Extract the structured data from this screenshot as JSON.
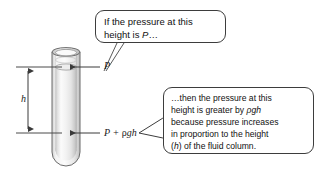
{
  "figure": {
    "background_color": "#ffffff"
  },
  "callouts": [
    {
      "id": "top",
      "name": "callout-pressure-at-top",
      "lines": [
        "If the pressure at this",
        "height is P…"
      ],
      "border_color": "#3d3d3d",
      "fill_color": "#ffffff"
    },
    {
      "id": "bottom",
      "name": "callout-pressure-at-bottom",
      "lines": [
        "…then the  pressure at this",
        "height  is greater by ρgh",
        "because pressure increases",
        "in proportion to the height",
        "(h) of the fluid column."
      ],
      "border_color": "#3d3d3d",
      "fill_color": "#ffffff"
    }
  ],
  "labels": {
    "pressure_top": "P",
    "pressure_bottom_prefix": "P + ",
    "pressure_bottom_rho": "ρ",
    "pressure_bottom_suffix": "gh",
    "height": "h"
  },
  "column": {
    "name": "fluid-column-cylinder",
    "outline_color": "#5e5e5e",
    "fluid_fill_light": "#fdfdfd",
    "fluid_fill_mid": "#e9e9e9",
    "fluid_fill_dark": "#c9c9c9",
    "reference_line_color": "#4a4a4a",
    "arrow_color": "#3a3a3a"
  }
}
